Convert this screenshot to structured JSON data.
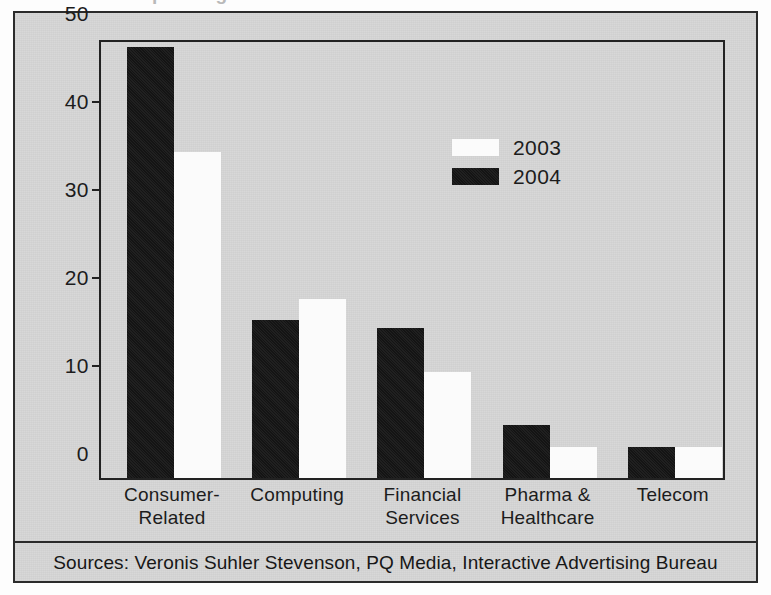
{
  "figure": {
    "title_sliver": "Ad Spending",
    "sources_note": "Sources: Veronis Suhler Stevenson, PQ Media, Interactive Advertising Bureau"
  },
  "legend": {
    "position": "inside-top-right",
    "entries": [
      {
        "label": "2003",
        "swatch": "white"
      },
      {
        "label": "2004",
        "swatch": "black"
      }
    ]
  },
  "axis": {
    "yticks": [
      "0",
      "10",
      "20",
      "30",
      "40",
      "50"
    ],
    "ytick_values": [
      0,
      10,
      20,
      30,
      40,
      50
    ]
  },
  "colors": {
    "series_2003": "#fbfbfb",
    "series_2004": "#141414",
    "frame": "#2b2b2b",
    "background": "#d6d6d6",
    "text": "#1c1c1c"
  },
  "chart_data": {
    "type": "bar",
    "title": "Ad Spending",
    "xlabel": "",
    "ylabel": "",
    "ylim": [
      0,
      50
    ],
    "grid": false,
    "legend_position": "inside-top-right",
    "categories": [
      "Consumer-\nRelated",
      "Computing",
      "Financial\nServices",
      "Pharma &\nHealthcare",
      "Telecom"
    ],
    "category_lines": [
      [
        "Consumer-",
        "Related"
      ],
      [
        "Computing",
        ""
      ],
      [
        "Financial",
        "Services"
      ],
      [
        "Pharma &",
        "Healthcare"
      ],
      [
        "Telecom",
        ""
      ]
    ],
    "series": [
      {
        "name": "2004",
        "color": "#141414",
        "values": [
          49,
          18,
          17,
          6,
          3.5
        ]
      },
      {
        "name": "2003",
        "color": "#fbfbfb",
        "values": [
          37,
          20.3,
          12,
          3.5,
          3.5
        ]
      }
    ],
    "series_order_in_group": [
      "2004",
      "2003"
    ],
    "annotations": [
      "Sources: Veronis Suhler Stevenson, PQ Media, Interactive Advertising Bureau"
    ]
  }
}
